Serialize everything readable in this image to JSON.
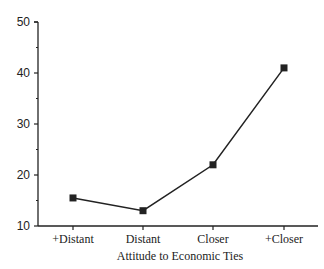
{
  "chart_data": {
    "type": "line",
    "title": "",
    "xlabel": "Attitude to Economic Ties",
    "ylabel": "",
    "categories": [
      "+Distant",
      "Distant",
      "Closer",
      "+Closer"
    ],
    "series": [
      {
        "name": "",
        "values": [
          15.5,
          13,
          22,
          41
        ]
      }
    ],
    "ylim": [
      10,
      50
    ],
    "yticks": [
      10,
      20,
      30,
      40,
      50
    ],
    "grid": false,
    "legend": "none",
    "marker": "square",
    "line_color": "#222222"
  }
}
